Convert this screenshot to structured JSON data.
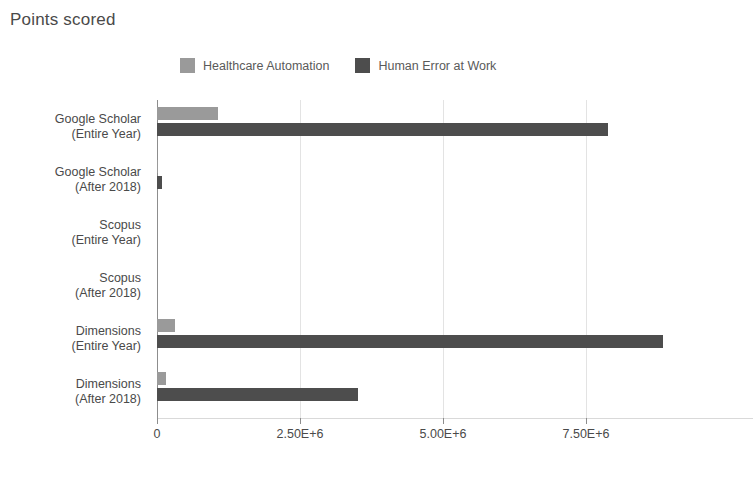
{
  "chart": {
    "title": "Points scored",
    "caption": ""
  },
  "legend": {
    "position": "top-center",
    "items": [
      {
        "label": "Healthcare Automation",
        "color": "#9a9a9a",
        "swatch_name": "legend-swatch-healthcare-automation"
      },
      {
        "label": "Human Error at Work",
        "color": "#4d4d4d",
        "swatch_name": "legend-swatch-human-error-at-work"
      }
    ]
  },
  "x_axis": {
    "ticks": [
      {
        "label": "0",
        "value": 0
      },
      {
        "label": "2.50E+6",
        "value": 2500000
      },
      {
        "label": "5.00E+6",
        "value": 5000000
      },
      {
        "label": "7.50E+6",
        "value": 7500000
      }
    ],
    "min": 0,
    "max": 10420000
  },
  "y_axis": {
    "categories": [
      {
        "line1": "Google Scholar",
        "line2": "(Entire Year)"
      },
      {
        "line1": "Google Scholar",
        "line2": "(After 2018)"
      },
      {
        "line1": "Scopus",
        "line2": "(Entire Year)"
      },
      {
        "line1": "Scopus",
        "line2": "(After 2018)"
      },
      {
        "line1": "Dimensions",
        "line2": "(Entire Year)"
      },
      {
        "line1": "Dimensions",
        "line2": "(After 2018)"
      }
    ]
  },
  "chart_data": {
    "type": "bar",
    "orientation": "horizontal",
    "title": "Points scored",
    "xlabel": "",
    "ylabel": "",
    "xlim": [
      0,
      10420000
    ],
    "grid": true,
    "legend_position": "top-center",
    "categories": [
      "Google Scholar (Entire Year)",
      "Google Scholar (After 2018)",
      "Scopus (Entire Year)",
      "Scopus (After 2018)",
      "Dimensions (Entire Year)",
      "Dimensions (After 2018)"
    ],
    "series": [
      {
        "name": "Healthcare Automation",
        "color": "#9a9a9a",
        "values": [
          1070000,
          20000,
          0,
          0,
          310000,
          160000
        ]
      },
      {
        "name": "Human Error at Work",
        "color": "#4d4d4d",
        "values": [
          7890000,
          90000,
          0,
          0,
          8850000,
          3510000
        ]
      }
    ],
    "xticks": [
      0,
      2500000,
      5000000,
      7500000
    ],
    "xticklabels": [
      "0",
      "2.50E+6",
      "5.00E+6",
      "7.50E+6"
    ]
  },
  "colors": {
    "series_light": "#9a9a9a",
    "series_dark": "#4d4d4d",
    "grid": "#e3e3e3",
    "axis": "#8d8d8d",
    "text": "#4a4a4a",
    "background": "#ffffff"
  }
}
